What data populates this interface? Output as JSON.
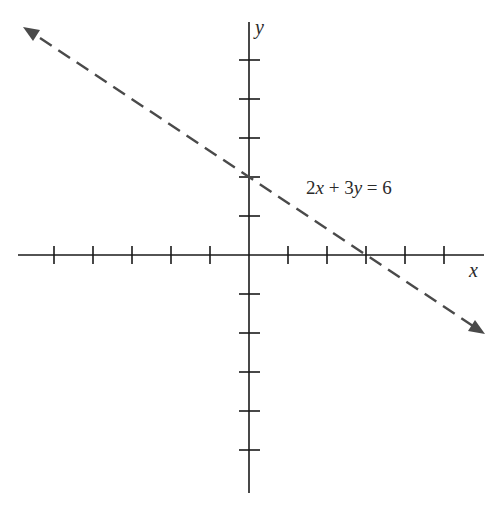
{
  "chart_data": {
    "type": "line",
    "title": "",
    "xlabel": "x",
    "ylabel": "y",
    "grid": false,
    "legend": null,
    "xlim": [
      -6,
      6
    ],
    "ylim": [
      -6,
      6
    ],
    "x_ticks": [
      -5,
      -4,
      -3,
      -2,
      -1,
      1,
      2,
      3,
      4,
      5
    ],
    "y_ticks": [
      -5,
      -4,
      -3,
      -2,
      -1,
      1,
      2,
      3,
      4,
      5
    ],
    "tick_labels_shown": false,
    "series": [
      {
        "name": "2x + 3y = 6",
        "style": "dashed",
        "arrows": "both",
        "color": "#4a4a4a",
        "x": [
          -5.7,
          0,
          3,
          6.0
        ],
        "y": [
          5.8,
          2,
          0,
          -2.0
        ]
      }
    ],
    "annotations": [
      {
        "text": "2x + 3y = 6",
        "x": 2.8,
        "y": 1.7
      }
    ],
    "intercepts": {
      "x_intercept": [
        3,
        0
      ],
      "y_intercept": [
        0,
        2
      ]
    }
  },
  "labels": {
    "x_axis": "x",
    "y_axis": "y",
    "equation_parts": [
      "2",
      "x",
      " + 3",
      "y",
      " = 6"
    ]
  },
  "colors": {
    "axis": "#1a1a1a",
    "line": "#4a4a4a",
    "background": "#ffffff"
  }
}
